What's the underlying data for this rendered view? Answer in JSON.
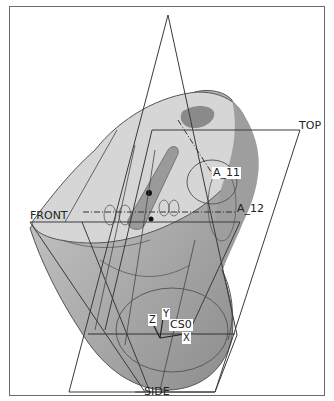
{
  "viewport": {
    "background": "#ffffff",
    "frame_color": "#6a6a6a"
  },
  "model": {
    "shade_light": "#d3d3d3",
    "shade_mid": "#b4b4b4",
    "shade_dark": "#8e8e8e",
    "edge_color": "#555555"
  },
  "datum_planes": {
    "top": {
      "label": "TOP"
    },
    "front": {
      "label": "FRONT"
    },
    "side": {
      "label": "SIDE"
    }
  },
  "datum_axes": {
    "a11": {
      "label": "A_11"
    },
    "a12": {
      "label": "A_12"
    }
  },
  "coordinate_system": {
    "label": "CS0",
    "x_label": "X",
    "y_label": "Y",
    "z_label": "Z"
  }
}
